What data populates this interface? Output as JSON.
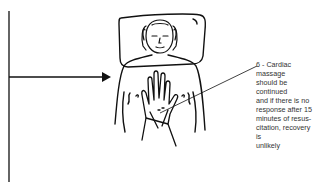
{
  "figure": {
    "step_number": "6",
    "caption": "6 - Cardiac massage\nshould be continued\nand if there is no\nresponse after 15\nminutes of resus-\ncitation, recovery is\nunlikely",
    "icons": [
      "flow-arrow-icon",
      "patient-lying-illustration",
      "hands-on-chest-icon"
    ],
    "colors": {
      "ink": "#111111",
      "text": "#333333",
      "background": "#ffffff"
    }
  }
}
